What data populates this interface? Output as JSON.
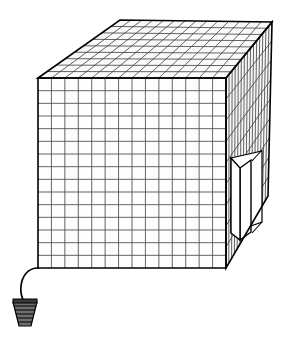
{
  "figure": {
    "kind": "line-drawing",
    "background_color": "#ffffff",
    "line_color": "#000000",
    "mesh_color": "#4a4a4a",
    "canvas": {
      "width": 293,
      "height": 339
    }
  },
  "geometry": {
    "front_face": {
      "name": "front-face",
      "top_left": [
        38,
        78
      ],
      "top_right": [
        226,
        78
      ],
      "bottom_right": [
        226,
        268
      ],
      "bottom_left": [
        38,
        268
      ],
      "mesh_columns": 14,
      "mesh_rows": 15
    },
    "top_face": {
      "name": "top-face",
      "front_left": [
        38,
        78
      ],
      "back_left": [
        120,
        20
      ],
      "back_right": [
        272,
        22
      ],
      "front_right": [
        226,
        78
      ],
      "mesh_columns": 14,
      "mesh_rows": 9
    },
    "right_face": {
      "name": "right-face",
      "front_top": [
        226,
        78
      ],
      "back_top": [
        272,
        22
      ],
      "back_bottom": [
        268,
        196
      ],
      "front_bottom": [
        226,
        268
      ],
      "mesh_columns": 9,
      "mesh_rows": 15
    },
    "door": {
      "name": "access-door",
      "opening": [
        [
          231,
          158
        ],
        [
          262,
          151
        ],
        [
          262,
          222
        ],
        [
          231,
          233
        ]
      ],
      "panel": [
        [
          240,
          168
        ],
        [
          251,
          160
        ],
        [
          251,
          232
        ],
        [
          240,
          240
        ]
      ],
      "state": "open"
    },
    "cord": {
      "name": "power-cord",
      "start": [
        38,
        268
      ],
      "path": "M38,268 C28,268 22,276 21,286 C20,294 22,298 24,302",
      "plug_center": [
        25,
        312
      ]
    },
    "plug": {
      "name": "screw-base-plug",
      "top_width": 24,
      "bottom_width": 12,
      "top_y": 302,
      "bottom_y": 326,
      "thread_count": 6
    }
  },
  "labels": {
    "alt_text": "Isometric line drawing of a cube made of fine wire mesh. A rectangular door on the right-hand face stands open, and an electrical cord with a screw-type plug trails from the lower-left corner."
  }
}
